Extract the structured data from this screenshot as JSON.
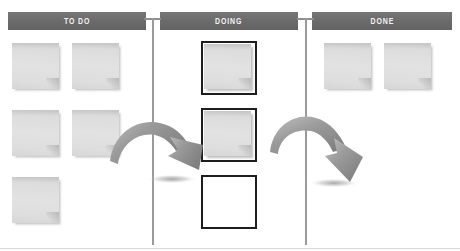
{
  "board": {
    "title": "Kanban Board",
    "background_color": "#ffffff",
    "header_color": "#6a6a6a",
    "header_text_color": "#f2f2f2",
    "divider_color": "#9a9a9a",
    "note_color": "#dcdcdc",
    "slot_border_color": "#1d1d1d",
    "arrow_color": "#8d8d8d"
  },
  "columns": [
    {
      "id": "todo",
      "label": "TO DO",
      "header": {
        "x": 8,
        "y": 12,
        "width": 138,
        "height": 18
      },
      "card_style": "plain",
      "card_count": 5,
      "cards": [
        {
          "index": 0,
          "x": 12,
          "y": 43,
          "state": "filled"
        },
        {
          "index": 1,
          "x": 72,
          "y": 43,
          "state": "filled"
        },
        {
          "index": 2,
          "x": 12,
          "y": 110,
          "state": "filled"
        },
        {
          "index": 3,
          "x": 72,
          "y": 110,
          "state": "filled"
        },
        {
          "index": 4,
          "x": 12,
          "y": 177,
          "state": "filled"
        }
      ]
    },
    {
      "id": "doing",
      "label": "DOING",
      "header": {
        "x": 160,
        "y": 12,
        "width": 138,
        "height": 18
      },
      "card_style": "framed",
      "card_count": 3,
      "cards": [
        {
          "index": 0,
          "x": 201,
          "y": 41,
          "state": "filled"
        },
        {
          "index": 1,
          "x": 201,
          "y": 108,
          "state": "filled"
        },
        {
          "index": 2,
          "x": 201,
          "y": 175,
          "state": "empty"
        }
      ]
    },
    {
      "id": "done",
      "label": "DONE",
      "header": {
        "x": 312,
        "y": 12,
        "width": 140,
        "height": 18
      },
      "card_style": "plain",
      "card_count": 2,
      "cards": [
        {
          "index": 0,
          "x": 324,
          "y": 43,
          "state": "filled"
        },
        {
          "index": 1,
          "x": 384,
          "y": 43,
          "state": "filled"
        }
      ]
    }
  ],
  "dividers": [
    {
      "id": "divider-todo-doing",
      "x": 152,
      "top": 18,
      "bottom": 245
    },
    {
      "id": "divider-doing-done",
      "x": 305,
      "top": 18,
      "bottom": 245
    }
  ],
  "arrows": [
    {
      "id": "arrow-todo-to-doing",
      "from_column": "todo",
      "to_column": "doing",
      "direction": "right-down",
      "shadow": true
    },
    {
      "id": "arrow-doing-to-done",
      "from_column": "doing",
      "to_column": "done",
      "direction": "right-down",
      "shadow": true
    }
  ]
}
